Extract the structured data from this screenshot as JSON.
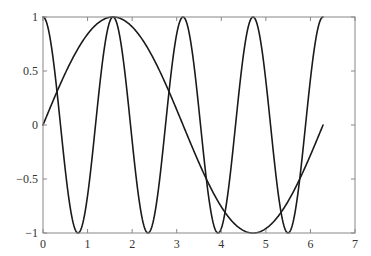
{
  "chart_data": {
    "type": "line",
    "title": "",
    "xlabel": "",
    "ylabel": "",
    "xlim": [
      0,
      7
    ],
    "ylim": [
      -1,
      1
    ],
    "grid": false,
    "legend": null,
    "x_ticks": [
      "0",
      "1",
      "2",
      "3",
      "4",
      "5",
      "6",
      "7"
    ],
    "y_ticks": [
      "1",
      "0.5",
      "0",
      "-0.5",
      "-1"
    ],
    "series": [
      {
        "name": "sin(x)",
        "function": "sin(x)",
        "x_range": [
          0,
          6.2832
        ],
        "sample_points": {
          "x": [
            0,
            0.785,
            1.571,
            2.356,
            3.142,
            3.927,
            4.712,
            5.498,
            6.283
          ],
          "y": [
            0,
            0.707,
            1,
            0.707,
            0,
            -0.707,
            -1,
            -0.707,
            0
          ]
        },
        "color": "#1a1a1a"
      },
      {
        "name": "cos(4x)",
        "function": "cos(4x)",
        "x_range": [
          0,
          6.2832
        ],
        "sample_points": {
          "x": [
            0,
            0.785,
            1.571,
            2.356,
            3.142,
            3.927,
            4.712,
            5.498,
            6.283
          ],
          "y": [
            1,
            -1,
            1,
            -1,
            1,
            -1,
            1,
            -1,
            1
          ]
        },
        "color": "#1a1a1a"
      }
    ]
  },
  "plot_area": {
    "left": 43,
    "right": 355,
    "top": 17,
    "bottom": 233
  }
}
